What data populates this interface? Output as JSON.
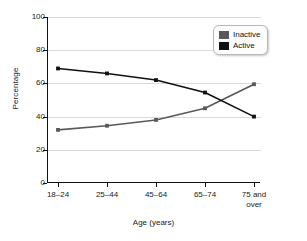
{
  "chart_data": {
    "type": "line",
    "title": "",
    "xlabel": "Age (years)",
    "ylabel": "Percentage",
    "categories": [
      "18–24",
      "25–44",
      "45–64",
      "65–74",
      "75 and over"
    ],
    "category_lines": [
      [
        "18–24"
      ],
      [
        "25–44"
      ],
      [
        "45–64"
      ],
      [
        "65–74"
      ],
      [
        "75 and",
        "over"
      ]
    ],
    "series": [
      {
        "name": "Inactive",
        "color": "#595959",
        "values": [
          32,
          34.5,
          38,
          45,
          59.5
        ]
      },
      {
        "name": "Active",
        "color": "#111111",
        "values": [
          69,
          66,
          62,
          54.5,
          40
        ]
      }
    ],
    "ylim": [
      0,
      100
    ],
    "yticks": [
      0,
      20,
      40,
      60,
      80,
      100
    ],
    "ytick_labels": [
      "0",
      "20",
      "40",
      "60",
      "80",
      "100"
    ],
    "grid": true,
    "legend_position": "top-right"
  },
  "legend": {
    "entries": [
      {
        "label": "Inactive",
        "color": "#595959"
      },
      {
        "label": "Active",
        "color": "#111111"
      }
    ]
  },
  "axes": {
    "x_title": "Age (years)",
    "y_title": "Percentage"
  }
}
